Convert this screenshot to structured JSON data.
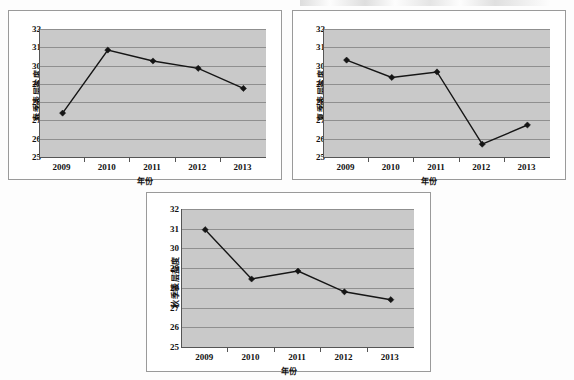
{
  "figure": {
    "background_color": "#fdfdfd",
    "plot_area_color": "#c9c9c9",
    "gridline_color": "#8f8f8f",
    "series_color": "#151515",
    "panel_border_color": "#9a9a9a"
  },
  "panels": [
    {
      "id": "spring",
      "name": "spring-surface-salinity-chart",
      "ylabel": "春季表层盐度",
      "xlabel": "年份",
      "yticks": [
        "32",
        "31",
        "30",
        "29",
        "28",
        "27",
        "26",
        "25"
      ],
      "xticks": [
        "2009",
        "2010",
        "2011",
        "2012",
        "2013"
      ]
    },
    {
      "id": "summer",
      "name": "summer-surface-salinity-chart",
      "ylabel": "夏季表层盐度",
      "xlabel": "年份",
      "yticks": [
        "32",
        "31",
        "30",
        "29",
        "28",
        "27",
        "26",
        "25"
      ],
      "xticks": [
        "2009",
        "2010",
        "2011",
        "2012",
        "2013"
      ]
    },
    {
      "id": "autumn",
      "name": "autumn-surface-salinity-chart",
      "ylabel": "秋季表层盐度",
      "xlabel": "年份",
      "yticks": [
        "32",
        "31",
        "30",
        "29",
        "28",
        "27",
        "26",
        "25"
      ],
      "xticks": [
        "2009",
        "2010",
        "2011",
        "2012",
        "2013"
      ]
    }
  ],
  "chart_data": [
    {
      "type": "line",
      "title": "",
      "xlabel": "年份",
      "ylabel": "春季表层盐度",
      "categories": [
        "2009",
        "2010",
        "2011",
        "2012",
        "2013"
      ],
      "values": [
        27.4,
        30.85,
        30.25,
        29.85,
        28.75
      ],
      "ylim": [
        25,
        32
      ],
      "ytick_step": 1,
      "grid": true,
      "legend": false,
      "marker": "diamond",
      "line_color": "#151515"
    },
    {
      "type": "line",
      "title": "",
      "xlabel": "年份",
      "ylabel": "夏季表层盐度",
      "categories": [
        "2009",
        "2010",
        "2011",
        "2012",
        "2013"
      ],
      "values": [
        30.3,
        29.35,
        29.65,
        25.7,
        26.75
      ],
      "ylim": [
        25,
        32
      ],
      "ytick_step": 1,
      "grid": true,
      "legend": false,
      "marker": "diamond",
      "line_color": "#151515"
    },
    {
      "type": "line",
      "title": "",
      "xlabel": "年份",
      "ylabel": "秋季表层盐度",
      "categories": [
        "2009",
        "2010",
        "2011",
        "2012",
        "2013"
      ],
      "values": [
        30.95,
        28.45,
        28.85,
        27.8,
        27.4
      ],
      "ylim": [
        25,
        32
      ],
      "ytick_step": 1,
      "grid": true,
      "legend": false,
      "marker": "diamond",
      "line_color": "#151515"
    }
  ]
}
